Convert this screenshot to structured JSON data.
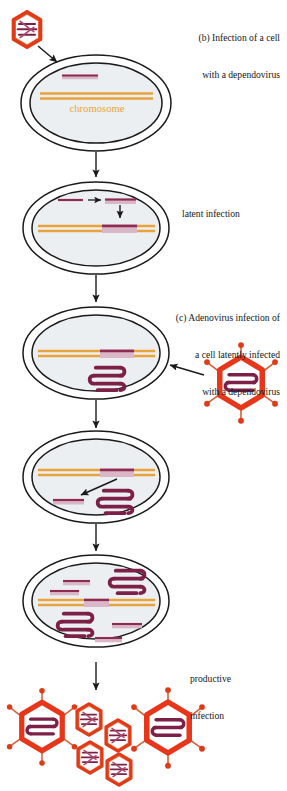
{
  "figure": {
    "width": 287,
    "height": 791
  },
  "captions": {
    "panel_b_line1": "(b) Infection of a cell",
    "panel_b_line2": "with a dependovirus",
    "panel_c_line1": "(c) Adenovirus infection of",
    "panel_c_line2": "a cell latently infected",
    "panel_c_line3": "with a dependovirus",
    "latent_infection": "latent infection",
    "productive_line1": "productive",
    "productive_line2": "infection"
  },
  "labels": {
    "chromosome": "chromosome"
  },
  "colors": {
    "chromosome_orange": "#e8a33d",
    "viral_dna_purple": "#8e2b52",
    "viral_dna_light": "#d9b7c7",
    "adenovirus_red": "#e8361b",
    "adenovirus_genome": "#7d2048",
    "dependovirus_red": "#e4401f",
    "cell_outline": "#1a1a1a",
    "nucleus_fill": "#eceff1",
    "fiber_orange": "#d4613a",
    "caption_text": "#17161a"
  },
  "stages": [
    {
      "id": "stage-1",
      "name": "cell-with-incoming-dependovirus",
      "contents": "single-stranded dependovirus DNA and host chromosome"
    },
    {
      "id": "stage-2",
      "name": "cell-latent-infection",
      "contents": "dependovirus DNA converted to duplex and integrated into chromosome"
    },
    {
      "id": "stage-3",
      "name": "cell-adenovirus-superinfection",
      "contents": "integrated provirus plus adenovirus genome"
    },
    {
      "id": "stage-4",
      "name": "cell-provirus-rescue",
      "contents": "dependovirus genome excised from chromosome"
    },
    {
      "id": "stage-5",
      "name": "cell-replication",
      "contents": "replicated dependovirus genomes and adenovirus genomes"
    },
    {
      "id": "stage-6",
      "name": "released-virions",
      "contents": "two adenovirus particles and four dependovirus particles"
    }
  ],
  "particles": {
    "dependovirus_name": "dependovirus-particle",
    "adenovirus_name": "adenovirus-particle",
    "released_adenovirus_count": 2,
    "released_dependovirus_count": 4
  }
}
